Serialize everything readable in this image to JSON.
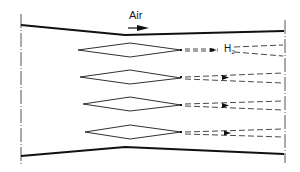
{
  "diagram": {
    "type": "schematic",
    "labels": {
      "air": "Air",
      "h2_main": "H",
      "h2_sub": "2"
    },
    "colors": {
      "line": "#1a1a1a",
      "wall": "#111111",
      "dashed": "#333333",
      "centerline": "#555555",
      "background": "#ffffff"
    },
    "components": {
      "walls": [
        "top-wall",
        "bottom-wall"
      ],
      "boundaries": [
        "inlet-dash-dot-line",
        "outlet-dash-dot-line"
      ],
      "injectors": [
        {
          "id": 1,
          "center_y": 50
        },
        {
          "id": 2,
          "center_y": 77
        },
        {
          "id": 3,
          "center_y": 104
        },
        {
          "id": 4,
          "center_y": 132
        }
      ],
      "flow_arrow": "air-flow-direction",
      "jets": "hydrogen-jet-plumes (dashed)"
    }
  }
}
